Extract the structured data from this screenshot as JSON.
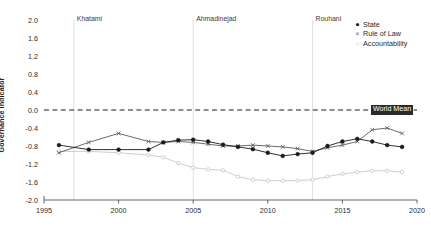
{
  "chart_data": {
    "type": "line",
    "title": "",
    "xlabel": "",
    "ylabel": "Governance Indicator",
    "xlim": [
      1995,
      2020
    ],
    "ylim": [
      -2.0,
      2.0
    ],
    "xticks": [
      1995,
      2000,
      2005,
      2010,
      2015,
      2020
    ],
    "yticks": [
      2.0,
      1.6,
      1.2,
      0.8,
      0.4,
      0.0,
      -0.4,
      -0.8,
      -1.2,
      -1.6,
      -2.0
    ],
    "ytick_labels": [
      "2.0",
      "1.6",
      "1.2",
      "0.8",
      "0.4",
      "0.0",
      "-0.4",
      "-0.8",
      "-1.2",
      "-1.6",
      "-2.0"
    ],
    "xtick_labels": [
      "1995",
      "2000",
      "2005",
      "2010",
      "2015",
      "2020"
    ],
    "grid": false,
    "legend_position": "top-right",
    "x": [
      1996,
      1998,
      2000,
      2002,
      2003,
      2004,
      2005,
      2006,
      2007,
      2008,
      2009,
      2010,
      2011,
      2012,
      2013,
      2014,
      2015,
      2016,
      2017,
      2018,
      2019
    ],
    "series": [
      {
        "name": "State",
        "marker": "filled-circle",
        "color": "#1a1a1a",
        "values": [
          -0.78,
          -0.88,
          -0.88,
          -0.88,
          -0.72,
          -0.67,
          -0.66,
          -0.7,
          -0.77,
          -0.82,
          -0.87,
          -0.95,
          -1.02,
          -0.98,
          -0.95,
          -0.8,
          -0.7,
          -0.64,
          -0.7,
          -0.78,
          -0.82
        ]
      },
      {
        "name": "Rule of Law",
        "marker": "x",
        "color": "#5a5a5a",
        "values": [
          -0.95,
          -0.72,
          -0.52,
          -0.7,
          -0.72,
          -0.7,
          -0.72,
          -0.76,
          -0.8,
          -0.8,
          -0.78,
          -0.8,
          -0.82,
          -0.86,
          -0.92,
          -0.84,
          -0.78,
          -0.7,
          -0.44,
          -0.4,
          -0.52
        ]
      },
      {
        "name": "Accountability",
        "marker": "open-circle",
        "color": "#c8c8c8",
        "values": [
          -0.92,
          -0.92,
          -0.95,
          -1.0,
          -1.05,
          -1.18,
          -1.28,
          -1.32,
          -1.34,
          -1.48,
          -1.55,
          -1.57,
          -1.57,
          -1.57,
          -1.55,
          -1.48,
          -1.42,
          -1.38,
          -1.35,
          -1.35,
          -1.38
        ]
      }
    ],
    "reference_line": {
      "label": "World Mean",
      "value": 0.0,
      "style": "dashed",
      "color": "#1a1a1a"
    },
    "annotations": [
      {
        "label": "Khatami",
        "x": 1997
      },
      {
        "label": "Ahmadinejad",
        "x": 2005
      },
      {
        "label": "Rouhani",
        "x": 2013
      }
    ]
  },
  "legend": {
    "items": [
      {
        "label": "State",
        "glyph": "●"
      },
      {
        "label": "Rule of Law",
        "glyph": "×"
      },
      {
        "label": "Accountability",
        "glyph": "○"
      }
    ]
  }
}
